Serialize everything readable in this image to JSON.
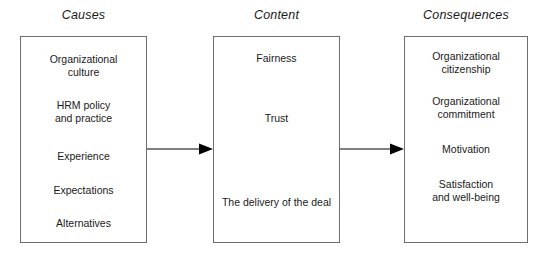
{
  "diagram": {
    "background_color": "#ffffff",
    "line_color": "#6e6e6e",
    "arrow_color": "#000000",
    "text_color": "#1a1a1a",
    "columns": [
      {
        "header": "Causes",
        "items": [
          "Organizational\nculture",
          "HRM policy\nand practice",
          "Experience",
          "Expectations",
          "Alternatives"
        ]
      },
      {
        "header": "Content",
        "items": [
          "Fairness",
          "Trust",
          "The delivery of the deal"
        ]
      },
      {
        "header": "Consequences",
        "items": [
          "Organizational\ncitizenship",
          "Organizational\ncommitment",
          "Motivation",
          "Satisfaction\nand well-being"
        ]
      }
    ],
    "connectors": [
      {
        "name": "arrow-causes-to-content",
        "from": "Causes",
        "to": "Content"
      },
      {
        "name": "arrow-content-to-consequences",
        "from": "Content",
        "to": "Consequences"
      }
    ]
  }
}
